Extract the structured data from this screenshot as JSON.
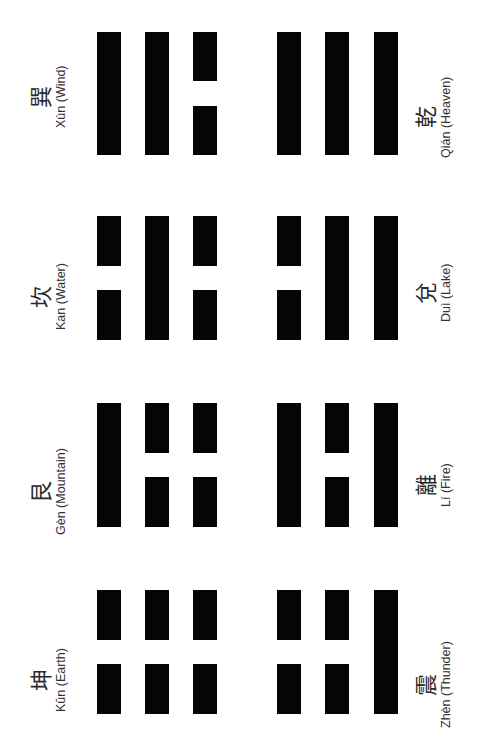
{
  "layout": {
    "rows": [
      {
        "y_top": 32,
        "y_bottom": 155
      },
      {
        "y_top": 216,
        "y_bottom": 340
      },
      {
        "y_top": 403,
        "y_bottom": 527
      },
      {
        "y_top": 590,
        "y_bottom": 714
      }
    ],
    "left_group_bar_x": [
      97,
      145,
      193
    ],
    "right_group_bar_x": [
      277,
      325,
      374
    ]
  },
  "trigrams": [
    {
      "hanzi": "巽",
      "name": "Xùn (Wind)",
      "column": "left",
      "row": 0,
      "lines": [
        "solid",
        "solid",
        "broken"
      ]
    },
    {
      "hanzi": "乾",
      "name": "Qián (Heaven)",
      "column": "right",
      "row": 0,
      "lines": [
        "solid",
        "solid",
        "solid"
      ]
    },
    {
      "hanzi": "坎",
      "name": "Kan (Water)",
      "column": "left",
      "row": 1,
      "lines": [
        "broken",
        "solid",
        "broken"
      ]
    },
    {
      "hanzi": "兌",
      "name": "Duì (Lake)",
      "column": "right",
      "row": 1,
      "lines": [
        "broken",
        "solid",
        "solid"
      ]
    },
    {
      "hanzi": "艮",
      "name": "Gèn (Mountain)",
      "column": "left",
      "row": 2,
      "lines": [
        "solid",
        "broken",
        "broken"
      ]
    },
    {
      "hanzi": "離",
      "name": "Lí (Fire)",
      "column": "right",
      "row": 2,
      "lines": [
        "solid",
        "broken",
        "solid"
      ]
    },
    {
      "hanzi": "坤",
      "name": "Kūn (Earth)",
      "column": "left",
      "row": 3,
      "lines": [
        "broken",
        "broken",
        "broken"
      ]
    },
    {
      "hanzi": "震",
      "name": "Zhèn (Thunder)",
      "column": "right",
      "row": 3,
      "lines": [
        "broken",
        "broken",
        "solid"
      ]
    }
  ]
}
